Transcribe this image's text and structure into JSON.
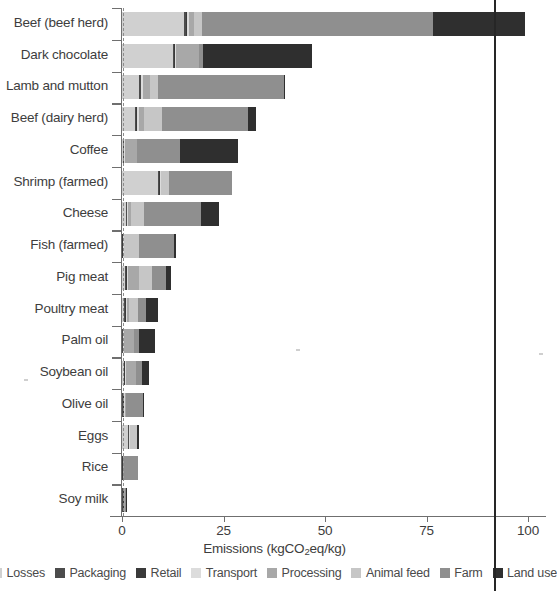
{
  "chart_data": {
    "type": "bar",
    "orientation": "horizontal",
    "stacked": true,
    "title": "",
    "xlabel": "Emissions (kgCO2eq/kg)",
    "xlabel_parts": {
      "pre": "Emissions (kgCO",
      "sub": "2",
      "post": "eq/kg)"
    },
    "ylabel": "",
    "xlim": [
      0,
      100
    ],
    "xticks": [
      0,
      25,
      50,
      75,
      100
    ],
    "xticklabels": [
      "0",
      "25",
      "50",
      "75",
      "100"
    ],
    "grid": false,
    "legend_position": "bottom",
    "categories": [
      "Beef (beef herd)",
      "Dark chocolate",
      "Lamb and mutton",
      "Beef (dairy herd)",
      "Coffee",
      "Shrimp (farmed)",
      "Cheese",
      "Fish (farmed)",
      "Pig meat",
      "Poultry meat",
      "Palm oil",
      "Soybean oil",
      "Olive oil",
      "Eggs",
      "Rice",
      "Soy milk"
    ],
    "series": [
      {
        "name": "Losses",
        "color": "#d0d0d0",
        "values": [
          15.3,
          12.6,
          4.3,
          3.1,
          0.3,
          8.8,
          1.0,
          0.0,
          0.8,
          0.6,
          0.1,
          0.4,
          0.0,
          1.6,
          0.0,
          0.1
        ]
      },
      {
        "name": "Packaging",
        "color": "#4c4c4c",
        "values": [
          0.4,
          0.3,
          0.3,
          0.4,
          0.2,
          0.4,
          0.2,
          0.1,
          0.3,
          0.2,
          0.1,
          0.2,
          0.3,
          0.1,
          0.1,
          0.2
        ]
      },
      {
        "name": "Retail",
        "color": "#3a3a3a",
        "values": [
          0.3,
          0.1,
          0.2,
          0.2,
          0.1,
          0.2,
          0.1,
          0.1,
          0.2,
          0.1,
          0.1,
          0.1,
          0.1,
          0.1,
          0.1,
          0.1
        ]
      },
      {
        "name": "Transport",
        "color": "#dcdcdc",
        "values": [
          0.4,
          0.2,
          0.5,
          0.4,
          0.2,
          0.2,
          0.2,
          0.3,
          0.3,
          0.3,
          0.2,
          0.2,
          0.3,
          0.2,
          0.1,
          0.1
        ]
      },
      {
        "name": "Processing",
        "color": "#a8a8a8",
        "values": [
          1.3,
          5.9,
          1.7,
          1.4,
          3.0,
          0.0,
          0.8,
          0.0,
          2.5,
          0.6,
          2.4,
          2.5,
          0.3,
          0.0,
          0.1,
          0.2
        ]
      },
      {
        "name": "Animal feed",
        "color": "#c6c6c6",
        "values": [
          1.9,
          0.0,
          2.0,
          4.4,
          0.0,
          2.1,
          3.1,
          3.7,
          3.4,
          2.1,
          0.0,
          0.0,
          0.0,
          1.7,
          0.0,
          0.0
        ]
      },
      {
        "name": "Farm",
        "color": "#8f8f8f",
        "values": [
          57.0,
          0.9,
          30.8,
          21.1,
          10.4,
          15.3,
          14.0,
          8.5,
          3.4,
          2.0,
          1.4,
          1.6,
          4.3,
          0.0,
          3.6,
          0.4
        ]
      },
      {
        "name": "Land use",
        "color": "#2f2f2f",
        "values": [
          22.6,
          26.7,
          0.3,
          2.0,
          14.5,
          0.0,
          4.5,
          0.5,
          1.3,
          2.9,
          3.8,
          1.6,
          0.2,
          0.6,
          0.0,
          0.1
        ]
      }
    ],
    "totals": [
      99.2,
      46.7,
      39.7,
      33.0,
      28.5,
      26.9,
      23.9,
      13.6,
      12.3,
      9.9,
      7.6,
      6.3,
      5.4,
      4.7,
      4.0,
      0.9
    ]
  },
  "legend": {
    "items": [
      {
        "label": "Losses",
        "color": "#d0d0d0"
      },
      {
        "label": "Packaging",
        "color": "#4c4c4c"
      },
      {
        "label": "Retail",
        "color": "#3a3a3a"
      },
      {
        "label": "Transport",
        "color": "#dcdcdc"
      },
      {
        "label": "Processing",
        "color": "#a8a8a8"
      },
      {
        "label": "Animal feed",
        "color": "#c6c6c6"
      },
      {
        "label": "Farm",
        "color": "#8f8f8f"
      },
      {
        "label": "Land use",
        "color": "#2f2f2f"
      }
    ]
  }
}
